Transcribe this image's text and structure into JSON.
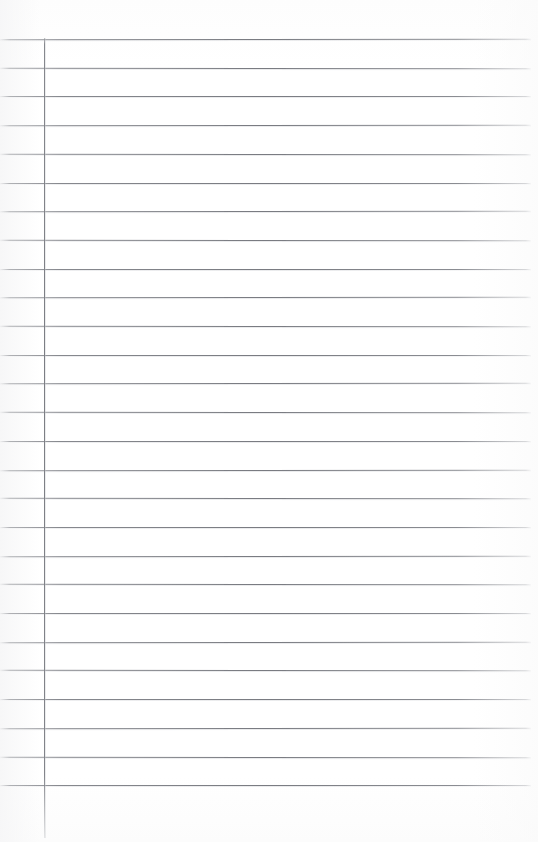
{
  "document": {
    "kind": "scanned-ruled-notebook-page",
    "title": "Blank Ruled Notebook Page",
    "page_width": 538,
    "page_height": 842,
    "background_color": "#ffffff",
    "written_content": "",
    "is_blank": true
  },
  "rules": {
    "line_color": "#7b7d83",
    "line_count": 27,
    "first_line_y": 39,
    "line_spacing": 28.7,
    "line_left_x": 0,
    "line_right_x": 531,
    "line_thickness": 1,
    "right_edge_fade": true,
    "left_edge_fade": true
  },
  "margin": {
    "margin_line_color": "#7c7e84",
    "margin_line_x": 44,
    "margin_line_top_y": 38,
    "margin_line_bottom_y": 838,
    "margin_line_thickness": 1
  }
}
